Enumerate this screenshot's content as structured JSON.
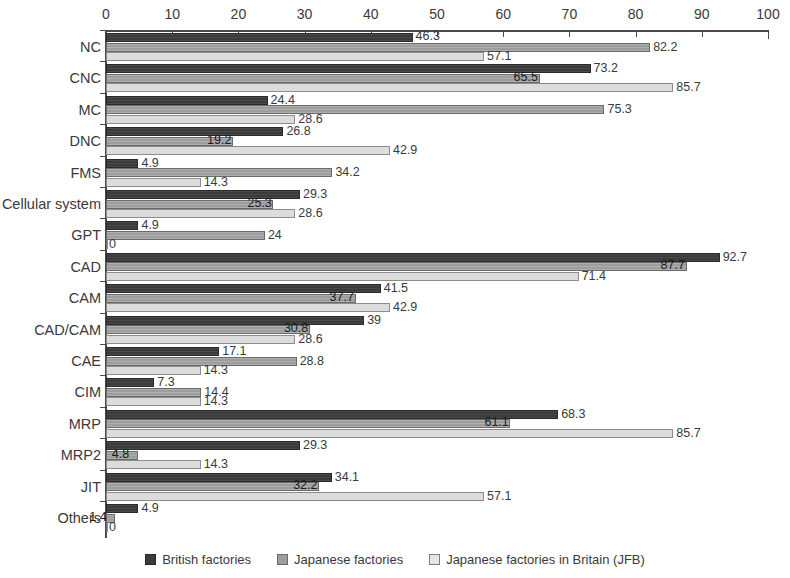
{
  "chart_data": {
    "type": "bar",
    "orientation": "horizontal",
    "title": "",
    "xlabel": "",
    "ylabel": "",
    "xlim": [
      0,
      100
    ],
    "xticks": [
      0,
      10,
      20,
      30,
      40,
      50,
      60,
      70,
      80,
      90,
      100
    ],
    "grid": false,
    "legend_position": "bottom",
    "categories": [
      "NC",
      "CNC",
      "MC",
      "DNC",
      "FMS",
      "Cellular system",
      "GPT",
      "CAD",
      "CAM",
      "CAD/CAM",
      "CAE",
      "CIM",
      "MRP",
      "MRP2",
      "JIT",
      "Others"
    ],
    "series": [
      {
        "name": "British factories",
        "color": "#3b3b3b",
        "values": [
          46.3,
          73.2,
          24.4,
          26.8,
          4.9,
          29.3,
          4.9,
          92.7,
          41.5,
          39,
          17.1,
          7.3,
          68.3,
          29.3,
          34.1,
          4.9
        ]
      },
      {
        "name": "Japanese factories",
        "color": "#9d9d9d",
        "values": [
          82.2,
          65.5,
          75.3,
          19.2,
          34.2,
          25.3,
          24,
          87.7,
          37.7,
          30.8,
          28.8,
          14.4,
          61.1,
          4.8,
          32.2,
          1.4
        ]
      },
      {
        "name": "Japanese factories in Britain (JFB)",
        "color": "#e6e6e6",
        "values": [
          57.1,
          85.7,
          28.6,
          42.9,
          14.3,
          28.6,
          0,
          71.4,
          42.9,
          28.6,
          14.3,
          14.3,
          85.7,
          14.3,
          57.1,
          0
        ]
      }
    ],
    "value_labels": [
      [
        "46.3",
        "82.2",
        "57.1"
      ],
      [
        "73.2",
        "65.5",
        "85.7"
      ],
      [
        "24.4",
        "75.3",
        "28.6"
      ],
      [
        "26.8",
        "19.2",
        "42.9"
      ],
      [
        "4.9",
        "34.2",
        "14.3"
      ],
      [
        "29.3",
        "25.3",
        "28.6"
      ],
      [
        "4.9",
        "24",
        "0"
      ],
      [
        "92.7",
        "87.7",
        "71.4"
      ],
      [
        "41.5",
        "37.7",
        "42.9"
      ],
      [
        "39",
        "30.8",
        "28.6"
      ],
      [
        "17.1",
        "28.8",
        "14.3"
      ],
      [
        "7.3",
        "14.4",
        "14.3"
      ],
      [
        "68.3",
        "61.1",
        "85.7"
      ],
      [
        "29.3",
        "4.8",
        "14.3"
      ],
      [
        "34.1",
        "32.2",
        "57.1"
      ],
      [
        "4.9",
        "1.4",
        "0"
      ]
    ]
  },
  "legend": {
    "items": [
      {
        "label": "British factories"
      },
      {
        "label": "Japanese factories"
      },
      {
        "label": "Japanese factories in Britain (JFB)"
      }
    ]
  }
}
